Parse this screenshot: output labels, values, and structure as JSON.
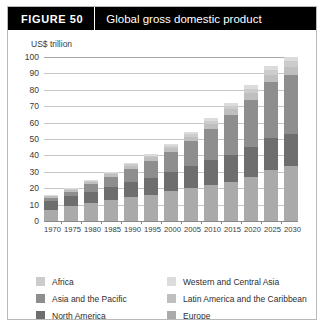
{
  "figure": {
    "number_label": "FIGURE  50",
    "title": "Global gross domestic product"
  },
  "chart_data": {
    "type": "bar",
    "subtype": "stacked-column",
    "title": "Global gross domestic product",
    "xlabel": "",
    "ylabel": "US$ trillion",
    "ylim": [
      0,
      100
    ],
    "yticks": [
      0,
      10,
      20,
      30,
      40,
      50,
      60,
      70,
      80,
      90,
      100
    ],
    "grid": true,
    "legend_position": "bottom",
    "categories": [
      "1970",
      "1975",
      "1980",
      "1985",
      "1990",
      "1995",
      "2000",
      "2005",
      "2010",
      "2015",
      "2020",
      "2025",
      "2030"
    ],
    "series": [
      {
        "name": "Europe",
        "color": "#aaaaaa",
        "values": [
          7.0,
          9.0,
          11.0,
          13.0,
          14.5,
          16.0,
          18.0,
          20.0,
          22.0,
          24.0,
          27.0,
          31.0,
          36.0
        ]
      },
      {
        "name": "North America",
        "color": "#6e6e6e",
        "values": [
          5.0,
          6.0,
          7.0,
          8.0,
          9.0,
          10.5,
          12.0,
          13.5,
          15.0,
          16.5,
          18.0,
          19.5,
          21.0
        ]
      },
      {
        "name": "Asia and the Pacific",
        "color": "#8e8e8e",
        "values": [
          2.0,
          3.0,
          4.5,
          6.0,
          8.0,
          10.0,
          12.0,
          15.0,
          19.0,
          24.0,
          29.0,
          34.0,
          39.0
        ]
      },
      {
        "name": "Latin America and the Caribbean",
        "color": "#bfbfbf",
        "values": [
          1.0,
          1.2,
          1.5,
          1.7,
          2.0,
          2.3,
          2.6,
          3.0,
          3.4,
          3.8,
          4.3,
          4.8,
          5.4
        ]
      },
      {
        "name": "Africa",
        "color": "#cccccc",
        "values": [
          0.5,
          0.6,
          0.7,
          0.8,
          1.0,
          1.1,
          1.3,
          1.5,
          1.8,
          2.1,
          2.5,
          3.0,
          3.6
        ]
      },
      {
        "name": "Western and Central Asia",
        "color": "#dcdcdc",
        "values": [
          0.4,
          0.5,
          0.6,
          0.7,
          0.8,
          0.9,
          1.0,
          1.2,
          1.4,
          1.7,
          2.0,
          2.4,
          2.8
        ]
      }
    ],
    "totals": [
      15.9,
      20.3,
      25.3,
      30.2,
      35.3,
      40.8,
      46.9,
      54.2,
      62.6,
      72.1,
      82.8,
      94.7,
      107.8
    ]
  },
  "legend": {
    "left_column": [
      {
        "label": "Africa",
        "color": "#cccccc"
      },
      {
        "label": "Asia and the Pacific",
        "color": "#8e8e8e"
      },
      {
        "label": "North America",
        "color": "#6e6e6e"
      }
    ],
    "right_column": [
      {
        "label": "Western and Central Asia",
        "color": "#dcdcdc"
      },
      {
        "label": "Latin America and the Caribbean",
        "color": "#bfbfbf"
      },
      {
        "label": "Europe",
        "color": "#aaaaaa"
      }
    ]
  }
}
